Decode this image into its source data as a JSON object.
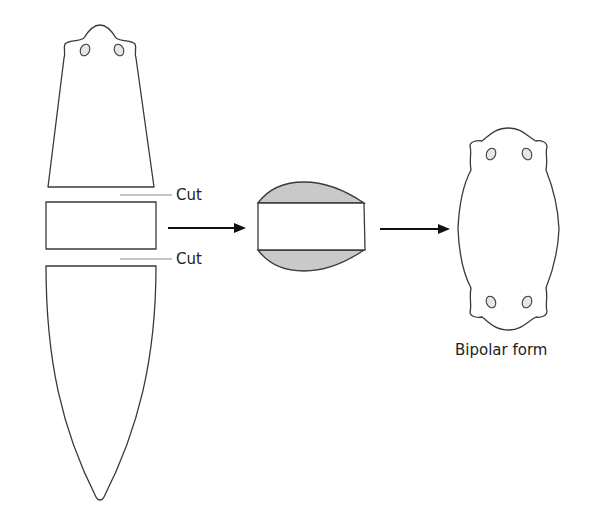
{
  "diagram": {
    "title": "",
    "labels": {
      "cut_top": "Cut",
      "cut_bottom": "Cut",
      "result": "Bipolar form"
    },
    "stages": [
      {
        "id": "cut-planarian",
        "description": "Planarian cut into three pieces"
      },
      {
        "id": "middle-fragment-regenerating",
        "description": "Middle fragment with regenerating caps at both ends"
      },
      {
        "id": "bipolar-form",
        "description": "Two-headed bipolar planarian"
      }
    ],
    "colors": {
      "outline": "#3a3a3a",
      "regenerating_cap": "#c9c9c9",
      "arrow": "#111111",
      "leader_line": "#8a8a8a"
    }
  }
}
